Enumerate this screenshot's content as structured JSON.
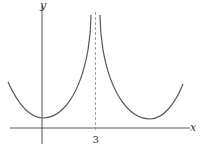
{
  "figure": {
    "axes": {
      "x_label": "x",
      "y_label": "y",
      "x_tick_label": "3"
    },
    "curve": {
      "description": "Graph symmetric about vertical asymptote x = 3, with two U-shaped branches rising to the asymptote",
      "asymptote": "x = 3 (dashed)",
      "colors": {
        "curve": "#555555",
        "axes": "#444444",
        "dashed": "#888888"
      }
    }
  }
}
